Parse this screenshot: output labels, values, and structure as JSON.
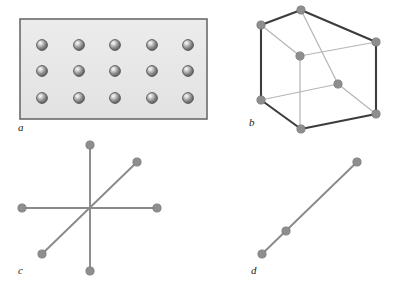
{
  "figure": {
    "background_color": "#ffffff",
    "width": 395,
    "height": 293
  },
  "style": {
    "sphere_fill": "#8a8a8a",
    "sphere_stroke": "#4a4a4a",
    "sphere_highlight": "#f0f0f0",
    "node_fill": "#8e8e8e",
    "node_stroke": "#7a7a7a",
    "line_color": "#8a8a8a",
    "edge_dark": "#3c3c3c",
    "edge_light": "#b4b4b4",
    "plate_fill": "#e8e8e8",
    "plate_stroke": "#6b6b6b",
    "label_color": "#1a1a1a"
  },
  "panels": [
    {
      "id": "a",
      "label": "a",
      "name": "panel-a-plate-lattice",
      "description": "Shaded rectangular plate containing a regular 5 by 3 grid of spheres",
      "plate": {
        "x": 20,
        "y": 19,
        "width": 187,
        "height": 100
      },
      "grid": {
        "columns": 5,
        "rows": 3,
        "sphere_radius": 5.5
      },
      "spheres": [
        {
          "cx": 42,
          "cy": 45
        },
        {
          "cx": 79,
          "cy": 45
        },
        {
          "cx": 115,
          "cy": 45
        },
        {
          "cx": 152,
          "cy": 45
        },
        {
          "cx": 188,
          "cy": 45
        },
        {
          "cx": 42,
          "cy": 71
        },
        {
          "cx": 79,
          "cy": 71
        },
        {
          "cx": 115,
          "cy": 71
        },
        {
          "cx": 152,
          "cy": 71
        },
        {
          "cx": 188,
          "cy": 71
        },
        {
          "cx": 42,
          "cy": 98
        },
        {
          "cx": 79,
          "cy": 98
        },
        {
          "cx": 115,
          "cy": 98
        },
        {
          "cx": 152,
          "cy": 98
        },
        {
          "cx": 188,
          "cy": 98
        }
      ]
    },
    {
      "id": "b",
      "label": "b",
      "name": "panel-b-cube-lattice",
      "description": "Wireframe cube in oblique projection with eight vertex nodes",
      "node_radius": 4.0,
      "vertices": [
        {
          "name": "front-top-left",
          "cx": 31,
          "cy": 25
        },
        {
          "name": "back-top-left",
          "cx": 71,
          "cy": 10
        },
        {
          "name": "back-top-right",
          "cx": 146,
          "cy": 42
        },
        {
          "name": "front-top-right",
          "cx": 70,
          "cy": 56
        },
        {
          "name": "front-bottom-left",
          "cx": 31,
          "cy": 100
        },
        {
          "name": "back-bottom-left",
          "cx": 71,
          "cy": 129
        },
        {
          "name": "back-bottom-right",
          "cx": 146,
          "cy": 114
        },
        {
          "name": "front-bottom-right",
          "cx": 108,
          "cy": 84
        }
      ],
      "edges_dark": [
        {
          "x1": 31,
          "y1": 25,
          "x2": 71,
          "y2": 10
        },
        {
          "x1": 71,
          "y1": 10,
          "x2": 146,
          "y2": 42
        },
        {
          "x1": 31,
          "y1": 25,
          "x2": 31,
          "y2": 100
        },
        {
          "x1": 146,
          "y1": 42,
          "x2": 146,
          "y2": 114
        },
        {
          "x1": 31,
          "y1": 100,
          "x2": 71,
          "y2": 129
        },
        {
          "x1": 71,
          "y1": 129,
          "x2": 146,
          "y2": 114
        }
      ],
      "edges_light": [
        {
          "x1": 31,
          "y1": 25,
          "x2": 70,
          "y2": 56
        },
        {
          "x1": 71,
          "y1": 10,
          "x2": 108,
          "y2": 84
        },
        {
          "x1": 70,
          "y1": 56,
          "x2": 146,
          "y2": 42
        },
        {
          "x1": 70,
          "y1": 56,
          "x2": 70,
          "y2": 56
        },
        {
          "x1": 31,
          "y1": 100,
          "x2": 108,
          "y2": 84
        },
        {
          "x1": 108,
          "y1": 84,
          "x2": 146,
          "y2": 114
        },
        {
          "x1": 108,
          "y1": 84,
          "x2": 108,
          "y2": 84
        },
        {
          "x1": 71,
          "y1": 129,
          "x2": 71,
          "y2": 10
        }
      ]
    },
    {
      "id": "c",
      "label": "c",
      "name": "panel-c-star-axes",
      "description": "Three straight lines intersecting at a common centre, six endpoint nodes, no centre node",
      "node_radius": 4.0,
      "center": {
        "x": 90,
        "y": 68
      },
      "lines": [
        {
          "name": "vertical-axis",
          "x1": 90,
          "y1": 5,
          "x2": 90,
          "y2": 131
        },
        {
          "name": "horizontal-axis",
          "x1": 22,
          "y1": 68,
          "x2": 157,
          "y2": 68
        },
        {
          "name": "diagonal-axis",
          "x1": 42,
          "y1": 114,
          "x2": 137,
          "y2": 22
        }
      ],
      "nodes": [
        {
          "name": "vertical-top",
          "cx": 90,
          "cy": 5
        },
        {
          "name": "vertical-bottom",
          "cx": 90,
          "cy": 131
        },
        {
          "name": "horizontal-left",
          "cx": 22,
          "cy": 68
        },
        {
          "name": "horizontal-right",
          "cx": 157,
          "cy": 68
        },
        {
          "name": "diagonal-lower-left",
          "cx": 42,
          "cy": 114
        },
        {
          "name": "diagonal-upper-right",
          "cx": 137,
          "cy": 22
        }
      ]
    },
    {
      "id": "d",
      "label": "d",
      "name": "panel-d-linear-chain",
      "description": "Single diagonal line bearing three collinear nodes",
      "node_radius": 4.0,
      "lines": [
        {
          "name": "chain-line",
          "x1": 62,
          "y1": 114,
          "x2": 157,
          "y2": 22
        }
      ],
      "nodes": [
        {
          "name": "chain-node-lower",
          "cx": 62,
          "cy": 114
        },
        {
          "name": "chain-node-middle",
          "cx": 86,
          "cy": 91
        },
        {
          "name": "chain-node-upper",
          "cx": 157,
          "cy": 22
        }
      ]
    }
  ]
}
